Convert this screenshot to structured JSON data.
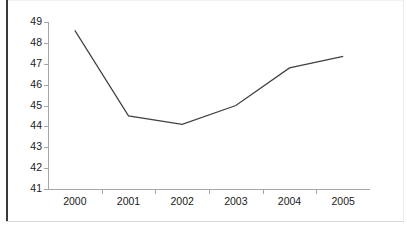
{
  "chart_data": {
    "type": "line",
    "title": "",
    "subtitle": "",
    "xlabel": "",
    "ylabel": "",
    "categories": [
      "2000",
      "2001",
      "2002",
      "2003",
      "2004",
      "2005"
    ],
    "series": [
      {
        "name": "series-1",
        "values": [
          48.6,
          44.5,
          44.1,
          45.0,
          46.8,
          47.35
        ],
        "color": "#404040"
      }
    ],
    "ylim": [
      41,
      49
    ],
    "ytick_labels": [
      "49",
      "48",
      "47",
      "46",
      "45",
      "44",
      "43",
      "42",
      "41"
    ],
    "ytick_values": [
      49,
      48,
      47,
      46,
      45,
      44,
      43,
      42,
      41
    ],
    "xtick_labels": [
      "2000",
      "2001",
      "2002",
      "2003",
      "2004",
      "2005"
    ],
    "grid": false,
    "legend": false,
    "legend_position": "none",
    "markers": false,
    "line_color": "#404040",
    "axis_color": "#a6a6a6",
    "background_color": "#ffffff"
  }
}
